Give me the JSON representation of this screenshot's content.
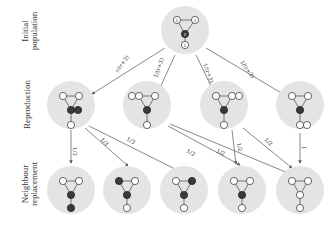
{
  "row_labels": {
    "initial": [
      "Initial",
      "population"
    ],
    "reproduction": "Reproduction",
    "neighbour": [
      "Neighbour",
      "replacement"
    ]
  },
  "initial_node_labels": {
    "top_left": "1",
    "top_right": "1",
    "center": "r",
    "bottom": "1"
  },
  "reproduction_probabilities": [
    "r/(r+3)",
    "1/(r+3)",
    "1/(r+3)",
    "1/(r+3)"
  ],
  "replacement_probabilities": {
    "r1_to_n1": "1/3",
    "r1_to_n2": "1/3",
    "r1_to_n3": "1/3",
    "r2_to_n4": "1/2",
    "r2_to_n5": "1/2",
    "r3_to_n4": "1/2",
    "r3_to_n5": "1/2",
    "r4_to_n5": "1"
  },
  "colors": {
    "mutant": "#3a3a3a",
    "resident": "#ffffff",
    "background_blob": "#e4e4e4"
  }
}
